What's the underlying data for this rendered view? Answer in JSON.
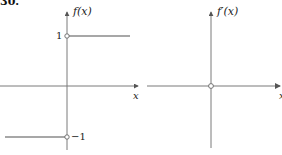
{
  "problem_number": "30.",
  "left_graph": {
    "y_axis_label": "f(x)",
    "x_axis_label": "x",
    "tick_upper": "1",
    "tick_lower": "−1",
    "segments": [
      {
        "from_x": 0,
        "to_x": "+inf",
        "y": 1,
        "left_endpoint": "open"
      },
      {
        "from_x": "-inf",
        "to_x": 0,
        "y": -1,
        "right_endpoint": "open"
      }
    ]
  },
  "right_graph": {
    "y_axis_label": "f′(x)",
    "x_axis_label": "x",
    "segments": [
      {
        "from_x": "-inf",
        "to_x": "+inf",
        "y": 0,
        "hole_at_x": 0
      }
    ]
  },
  "colors": {
    "axis": "#7a7a7a",
    "curve": "#8a8a8a",
    "text": "#222222"
  }
}
